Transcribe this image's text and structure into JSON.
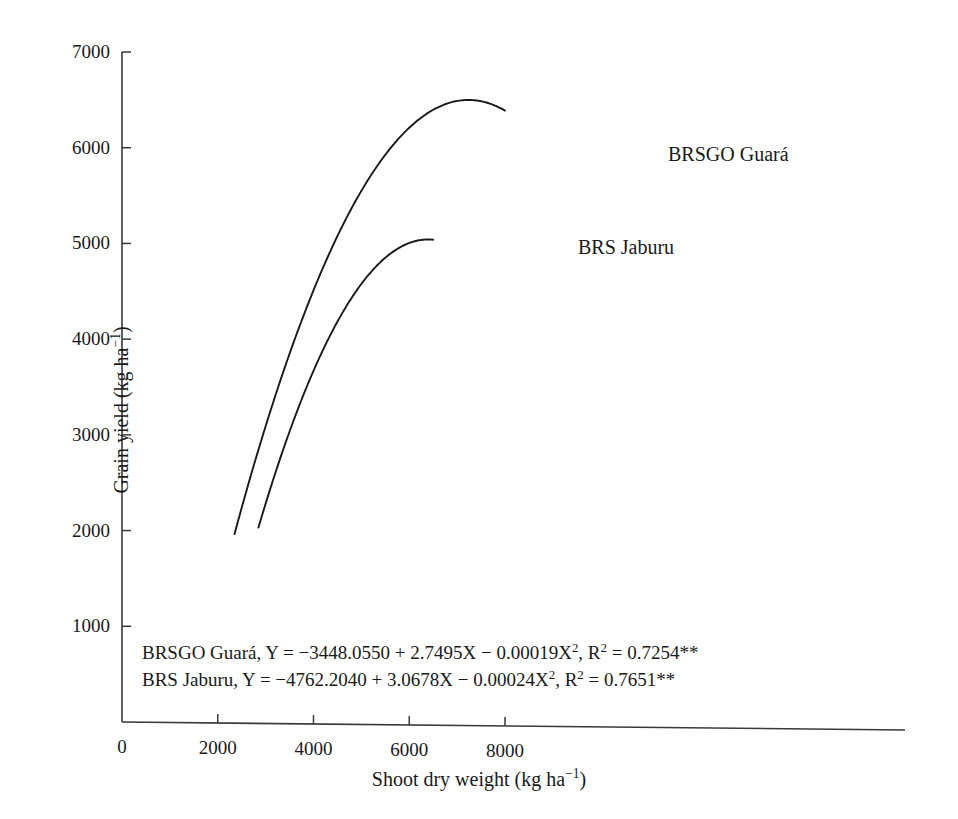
{
  "chart_data": {
    "type": "line",
    "title": "",
    "xlabel": "Shoot dry weight (kg ha⁻¹)",
    "ylabel": "Grain yield (kg ha⁻¹)",
    "xlim": [
      0,
      9200
    ],
    "ylim": [
      0,
      7000
    ],
    "xticks": [
      0,
      2000,
      4000,
      6000,
      8000
    ],
    "xtick_labels": [
      "0",
      "2000",
      "4000",
      "6000",
      "8000"
    ],
    "yticks": [
      1000,
      2000,
      3000,
      4000,
      5000,
      6000,
      7000
    ],
    "ytick_labels": [
      "1000",
      "2000",
      "3000",
      "4000",
      "5000",
      "6000",
      "7000"
    ],
    "grid": false,
    "legend": "inline-labels",
    "line_color": "#1a1a1a",
    "series": [
      {
        "name": "BRSGO Guará",
        "model": "quadratic",
        "coefficients": {
          "intercept": -3448.055,
          "linear": 2.7495,
          "quadratic": -0.00019
        },
        "r_squared": 0.7254,
        "significance": "**",
        "x_range": [
          2350,
          8000
        ],
        "x": [
          2350,
          2900,
          3500,
          4100,
          4700,
          5300,
          5900,
          6500,
          7100,
          7600,
          8000
        ],
        "values": [
          1960,
          2922,
          3836,
          4644,
          5346,
          5942,
          6432,
          6816,
          7094,
          7237,
          7297
        ],
        "label_position": {
          "x": 8150,
          "y": 6020
        }
      },
      {
        "name": "BRS Jaburu",
        "model": "quadratic",
        "coefficients": {
          "intercept": -4762.204,
          "linear": 3.0678,
          "quadratic": -0.00024
        },
        "r_squared": 0.7651,
        "significance": "**",
        "x_range": [
          2850,
          6500
        ],
        "x": [
          2850,
          3300,
          3800,
          4300,
          4800,
          5300,
          5800,
          6100,
          6500
        ],
        "values": [
          1717,
          2754,
          3428,
          4021,
          4536,
          4971,
          5327,
          5503,
          5695
        ],
        "label_position": {
          "x": 6700,
          "y": 5000
        }
      }
    ],
    "annotations": [
      {
        "id": "equation-guara",
        "series": "BRSGO Guará",
        "prefix": "BRSGO Guará, Y = ",
        "body": "−3448.0550 + 2.7495X − 0.00019X",
        "exponent": "2",
        "separator": ",  R",
        "r_exponent": "2",
        "r_value": " = 0.7254",
        "stars": "**"
      },
      {
        "id": "equation-jaburu",
        "series": "BRS Jaburu",
        "prefix": "BRS Jaburu, Y = ",
        "body": " −4762.2040 + 3.0678X − 0.00024X",
        "exponent": "2",
        "separator": ",  R",
        "r_exponent": "2",
        "r_value": " = 0.7651",
        "stars": "**"
      }
    ]
  },
  "axes": {
    "x_title": "Shoot dry weight (kg ha⁻¹)",
    "y_title": "Grain yield (kg ha⁻¹)"
  },
  "labels": {
    "guara": "BRSGO Guará",
    "jaburu": "BRS Jaburu"
  }
}
